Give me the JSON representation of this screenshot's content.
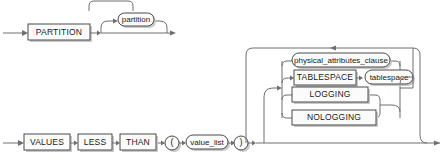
{
  "diagram": {
    "type": "railroad-syntax-diagram",
    "colors": {
      "line": "#6e6e6e",
      "box_border": "#4a4a4a",
      "box_fill": "#fbfbfb",
      "shadow": "#c9c9c9",
      "text": "#1a1a1a",
      "background": "#ffffff"
    },
    "rows": {
      "partition_row": {
        "keyword": "PARTITION",
        "optional_bubble": "partition"
      },
      "values_row": {
        "keyword_1": "VALUES",
        "keyword_2": "LESS",
        "keyword_3": "THAN",
        "paren_open": "(",
        "value_list": "value_list",
        "paren_close": ")"
      }
    },
    "options_group": {
      "items": [
        {
          "kind": "bubble",
          "label": "physical_attributes_clause"
        },
        {
          "kind": "box",
          "label": "TABLESPACE",
          "arg_bubble": "tablespace"
        },
        {
          "kind": "box",
          "label": "LOGGING"
        },
        {
          "kind": "box",
          "label": "NOLOGGING"
        }
      ]
    }
  }
}
